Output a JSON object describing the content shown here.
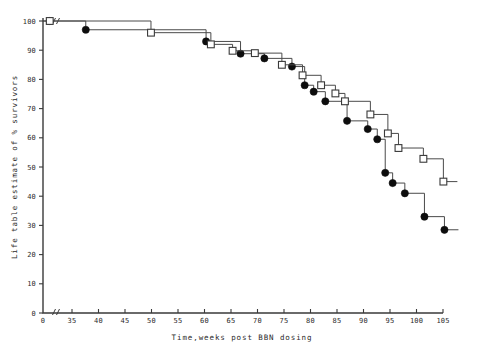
{
  "chart_data": {
    "type": "line",
    "title": "",
    "subtitle": "",
    "xlabel": "Time,weeks post BBN dosing",
    "ylabel": "Life table estimate of % survivors",
    "xlim": [
      30,
      105
    ],
    "ylim": [
      0,
      100
    ],
    "axis_break_x": true,
    "grid": false,
    "legend_position": "none",
    "x_ticks": [
      35,
      40,
      45,
      50,
      55,
      60,
      65,
      70,
      75,
      80,
      85,
      90,
      95,
      100,
      105
    ],
    "x_tick_labels": [
      "35",
      "40",
      "45",
      "50",
      "55",
      "60",
      "65",
      "70",
      "75",
      "80",
      "85",
      "90",
      "95",
      "100",
      "105"
    ],
    "x_origin_label": "0",
    "y_ticks": [
      0,
      10,
      20,
      30,
      40,
      50,
      60,
      70,
      80,
      90,
      100
    ],
    "y_tick_labels": [
      "0",
      "10",
      "20",
      "30",
      "40",
      "50",
      "60",
      "70",
      "80",
      "90",
      "100"
    ],
    "series": [
      {
        "name": "filled-circle-group",
        "marker": "filled-circle",
        "step": "post",
        "x": [
          30.8,
          37.6,
          60.3,
          66.8,
          71.3,
          76.5,
          78.9,
          80.6,
          82.8,
          86.9,
          90.8,
          92.6,
          94.1,
          95.5,
          97.8,
          101.5
        ],
        "y": [
          100.0,
          97.0,
          93.0,
          88.8,
          87.2,
          84.4,
          78.0,
          75.8,
          72.5,
          65.8,
          63.0,
          59.5,
          48.0,
          44.5,
          41.0,
          33.0
        ],
        "y_final": 28.5
      },
      {
        "name": "open-square-group",
        "marker": "open-square",
        "step": "post",
        "x": [
          30.8,
          49.9,
          61.2,
          65.3,
          69.5,
          74.6,
          78.5,
          82.0,
          84.7,
          86.5,
          91.3,
          94.6,
          96.6,
          101.3
        ],
        "y": [
          100.0,
          96.0,
          92.0,
          89.8,
          89.0,
          85.0,
          81.4,
          78.0,
          75.2,
          72.5,
          68.0,
          61.5,
          56.5,
          52.8
        ],
        "y_final": 45.0
      }
    ]
  }
}
